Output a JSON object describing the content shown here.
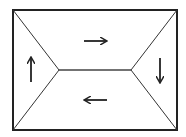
{
  "diagram": {
    "type": "hip-roof-flow",
    "colors": {
      "stroke": "#222222",
      "background": "#ffffff"
    },
    "outer_rect": {
      "x1": 13,
      "y1": 10,
      "x2": 177,
      "y2": 130
    },
    "ridge": {
      "x1": 59,
      "y1": 70,
      "x2": 131,
      "y2": 70
    },
    "arrows": [
      {
        "region": "top",
        "direction": "right",
        "icon": "arrow-right-icon"
      },
      {
        "region": "right",
        "direction": "down",
        "icon": "arrow-down-icon"
      },
      {
        "region": "bottom",
        "direction": "left",
        "icon": "arrow-left-icon"
      },
      {
        "region": "left",
        "direction": "up",
        "icon": "arrow-up-icon"
      }
    ]
  }
}
